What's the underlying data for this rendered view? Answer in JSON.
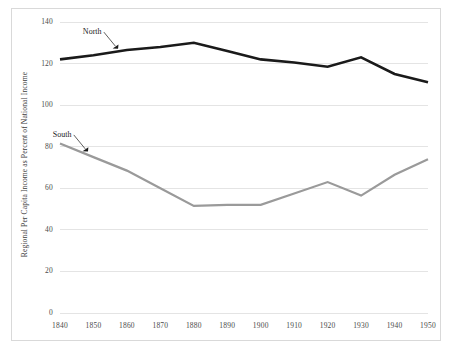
{
  "chart_data": {
    "type": "line",
    "title": "",
    "xlabel": "",
    "ylabel": "Regional Per Capita Income as Percent of National Income",
    "x": [
      1840,
      1850,
      1860,
      1870,
      1880,
      1890,
      1900,
      1910,
      1920,
      1930,
      1940,
      1950
    ],
    "categories": [
      "1840",
      "1850",
      "1860",
      "1870",
      "1880",
      "1890",
      "1900",
      "1910",
      "1920",
      "1930",
      "1940",
      "1950"
    ],
    "xlim": [
      1840,
      1950
    ],
    "ylim": [
      0,
      140
    ],
    "yticks": [
      0,
      20,
      40,
      60,
      80,
      100,
      120,
      140
    ],
    "ytick_labels": [
      "0",
      "20",
      "40",
      "60",
      "80",
      "100",
      "120",
      "140"
    ],
    "grid": true,
    "grid_axis": "y",
    "legend": "inline-annotations",
    "series": [
      {
        "name": "North",
        "color": "#1a1a1a",
        "line_width": 2.6,
        "values": [
          122,
          124,
          126.5,
          128,
          130,
          126,
          122,
          120.5,
          118.5,
          123,
          115,
          111
        ]
      },
      {
        "name": "South",
        "color": "#9a9a9a",
        "line_width": 2.2,
        "values": [
          81.5,
          75,
          68.5,
          60,
          51.5,
          52,
          52,
          57.5,
          63,
          56.5,
          66.5,
          74
        ]
      }
    ],
    "annotations": [
      {
        "text": "North",
        "series": "North",
        "points_to_x": 1857
      },
      {
        "text": "South",
        "series": "South",
        "points_to_x": 1848
      }
    ],
    "colors": {
      "north_line": "#1a1a1a",
      "south_line": "#9a9a9a",
      "gridline": "#e4e4e4",
      "frame": "#d9d9d9",
      "tick_text": "#4a4a4a",
      "background": "#ffffff"
    }
  }
}
